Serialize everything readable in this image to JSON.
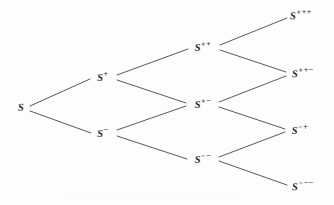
{
  "figure": {
    "name": "recombining-binomial-tree",
    "background_color": "#fdfdfd",
    "line_color": "#3a3a4a",
    "text_color": "#2e2e3c",
    "steps": 3
  },
  "nodes": [
    {
      "id": "s",
      "base": "S",
      "sup": "",
      "x": 21,
      "y": 108,
      "step": 0
    },
    {
      "id": "sp",
      "base": "S",
      "sup": "+",
      "x": 103,
      "y": 77,
      "step": 1
    },
    {
      "id": "sm",
      "base": "S",
      "sup": "−",
      "x": 103,
      "y": 133,
      "step": 1
    },
    {
      "id": "spp",
      "base": "S",
      "sup": "++",
      "x": 203,
      "y": 47,
      "step": 2
    },
    {
      "id": "spm",
      "base": "S",
      "sup": "+−",
      "x": 203,
      "y": 104,
      "step": 2
    },
    {
      "id": "smm",
      "base": "S",
      "sup": "−−",
      "x": 203,
      "y": 159,
      "step": 2
    },
    {
      "id": "sppp",
      "base": "S",
      "sup": "+++",
      "x": 301,
      "y": 15,
      "step": 3
    },
    {
      "id": "sppm",
      "base": "S",
      "sup": "++−",
      "x": 303,
      "y": 73,
      "step": 3
    },
    {
      "id": "smp",
      "base": "S",
      "sup": "−+",
      "x": 300,
      "y": 130,
      "step": 3
    },
    {
      "id": "smmm",
      "base": "S",
      "sup": "−−−",
      "x": 303,
      "y": 186,
      "step": 3
    }
  ],
  "edges": [
    {
      "from": "s",
      "to": "sp",
      "direction": "up",
      "x1": 30,
      "y1": 106,
      "x2": 90,
      "y2": 79
    },
    {
      "from": "s",
      "to": "sm",
      "direction": "down",
      "x1": 30,
      "y1": 111,
      "x2": 91,
      "y2": 133
    },
    {
      "from": "sp",
      "to": "spp",
      "direction": "up",
      "x1": 117,
      "y1": 75,
      "x2": 188,
      "y2": 49
    },
    {
      "from": "sp",
      "to": "spm",
      "direction": "down",
      "x1": 117,
      "y1": 80,
      "x2": 186,
      "y2": 103
    },
    {
      "from": "sm",
      "to": "spm",
      "direction": "up",
      "x1": 117,
      "y1": 130,
      "x2": 186,
      "y2": 106
    },
    {
      "from": "sm",
      "to": "smm",
      "direction": "down",
      "x1": 117,
      "y1": 136,
      "x2": 187,
      "y2": 159
    },
    {
      "from": "spp",
      "to": "sppp",
      "direction": "up",
      "x1": 220,
      "y1": 45,
      "x2": 287,
      "y2": 18
    },
    {
      "from": "spp",
      "to": "sppm",
      "direction": "down",
      "x1": 220,
      "y1": 50,
      "x2": 286,
      "y2": 72
    },
    {
      "from": "spm",
      "to": "sppm",
      "direction": "up",
      "x1": 219,
      "y1": 102,
      "x2": 286,
      "y2": 76
    },
    {
      "from": "spm",
      "to": "smp",
      "direction": "down",
      "x1": 219,
      "y1": 107,
      "x2": 285,
      "y2": 129
    },
    {
      "from": "smm",
      "to": "smp",
      "direction": "up",
      "x1": 219,
      "y1": 157,
      "x2": 285,
      "y2": 132
    },
    {
      "from": "smm",
      "to": "smmm",
      "direction": "down",
      "x1": 219,
      "y1": 161,
      "x2": 287,
      "y2": 185
    }
  ]
}
